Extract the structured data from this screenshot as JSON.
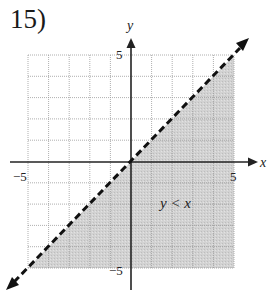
{
  "problem": {
    "number_label": "15)"
  },
  "graph": {
    "x_axis_label": "x",
    "y_axis_label": "y",
    "x_min_label": "−5",
    "x_max_label": "5",
    "y_max_label": "5",
    "y_min_label": "−5",
    "inequality_label": "y < x",
    "boundary_line": "dashed",
    "shaded_region": "below line",
    "colors": {
      "shade": "#cfcfcf",
      "grid": "#9a9a9a",
      "axis": "#222222",
      "line": "#111111"
    }
  }
}
